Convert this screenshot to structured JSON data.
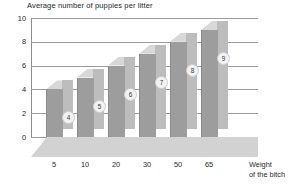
{
  "chart_data": {
    "type": "bar",
    "title": "Average number of puppies per litter",
    "xlabel": "Weight of the bitch",
    "ylabel": "",
    "categories": [
      "5",
      "10",
      "20",
      "30",
      "50",
      "65"
    ],
    "values": [
      4,
      5,
      6,
      7,
      8,
      9
    ],
    "point_labels": [
      "4",
      "5",
      "6",
      "7",
      "8",
      "9"
    ],
    "ylim": [
      0,
      10
    ],
    "ytick_labels": [
      "10",
      "8",
      "6",
      "4",
      "2",
      "0"
    ],
    "ytick_values": [
      10,
      8,
      6,
      4,
      2,
      0
    ],
    "grid": true,
    "legend": "none",
    "style": "3d-bar",
    "colors": {
      "bar_front": "#9d9d9d",
      "bar_side": "#bdbdbd",
      "bar_top": "#d8d8d8",
      "floor": "#d2d2d2",
      "gridline": "#9c9c9c",
      "axis": "#8d8d8d",
      "text": "#1f1f1f",
      "label_bubble": "#f2f2f2"
    }
  },
  "xaxis_title_lines": [
    "Weight",
    "of the bitch"
  ]
}
